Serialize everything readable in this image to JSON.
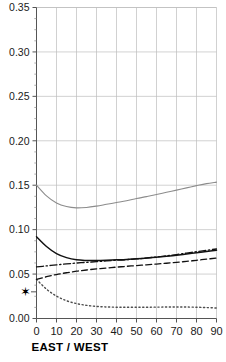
{
  "chart_data": {
    "type": "line",
    "title": "",
    "subtitle": "",
    "xlabel": "EAST / WEST",
    "ylabel": "",
    "xlim": [
      0,
      90
    ],
    "ylim": [
      0.0,
      0.35
    ],
    "grid": true,
    "legend": "none",
    "x_ticks": [
      0,
      10,
      20,
      30,
      40,
      50,
      60,
      70,
      80,
      90
    ],
    "x_tick_labels": [
      "0",
      "10",
      "20",
      "30",
      "40",
      "50",
      "60",
      "70",
      "80",
      "90"
    ],
    "y_ticks": [
      0.0,
      0.05,
      0.1,
      0.15,
      0.2,
      0.25,
      0.3,
      0.35
    ],
    "y_tick_labels": [
      "0.00",
      "0.05",
      "0.10",
      "0.15",
      "0.20",
      "0.25",
      "0.30",
      "0.35"
    ],
    "y_minor_tick_step": 0.0125,
    "x": [
      0,
      5,
      10,
      15,
      20,
      25,
      30,
      35,
      40,
      45,
      50,
      55,
      60,
      65,
      70,
      75,
      80,
      85,
      90
    ],
    "series": [
      {
        "name": "upper-gray-curve",
        "style": "solid",
        "color": "#8c8c8c",
        "width": 1.1,
        "values": [
          0.15,
          0.138,
          0.13,
          0.126,
          0.1245,
          0.125,
          0.1265,
          0.1285,
          0.1305,
          0.1325,
          0.135,
          0.1372,
          0.1395,
          0.142,
          0.1445,
          0.147,
          0.1495,
          0.1518,
          0.1535
        ]
      },
      {
        "name": "solid-black-curve",
        "style": "solid",
        "color": "#111111",
        "width": 1.5,
        "values": [
          0.092,
          0.081,
          0.073,
          0.0685,
          0.066,
          0.0653,
          0.0652,
          0.0655,
          0.066,
          0.0665,
          0.0672,
          0.068,
          0.069,
          0.07,
          0.0712,
          0.0725,
          0.074,
          0.0755,
          0.0768
        ]
      },
      {
        "name": "dash-dot-curve",
        "style": "dashdot",
        "color": "#111111",
        "width": 1.3,
        "values": [
          0.058,
          0.0592,
          0.0604,
          0.0614,
          0.0624,
          0.0632,
          0.064,
          0.0648,
          0.0655,
          0.0662,
          0.067,
          0.068,
          0.0692,
          0.0705,
          0.072,
          0.0736,
          0.0752,
          0.0768,
          0.0782
        ]
      },
      {
        "name": "dashed-curve",
        "style": "dashed",
        "color": "#111111",
        "width": 1.3,
        "values": [
          0.044,
          0.047,
          0.0495,
          0.0515,
          0.0532,
          0.0546,
          0.0558,
          0.0568,
          0.0578,
          0.0587,
          0.0596,
          0.0604,
          0.0613,
          0.0622,
          0.0632,
          0.0643,
          0.0655,
          0.0668,
          0.068
        ]
      },
      {
        "name": "dotted-curve",
        "style": "dotted",
        "color": "#4d4d4d",
        "width": 1.4,
        "values": [
          0.044,
          0.033,
          0.0252,
          0.02,
          0.0168,
          0.0148,
          0.0136,
          0.013,
          0.0127,
          0.0126,
          0.0126,
          0.0127,
          0.0128,
          0.0129,
          0.013,
          0.0129,
          0.0127,
          0.0123,
          0.0118
        ]
      }
    ],
    "annotations": [
      {
        "name": "star-marker",
        "glyph": "star",
        "x_position": "left-of-axis",
        "y_value": 0.03,
        "label": "✶"
      }
    ]
  }
}
